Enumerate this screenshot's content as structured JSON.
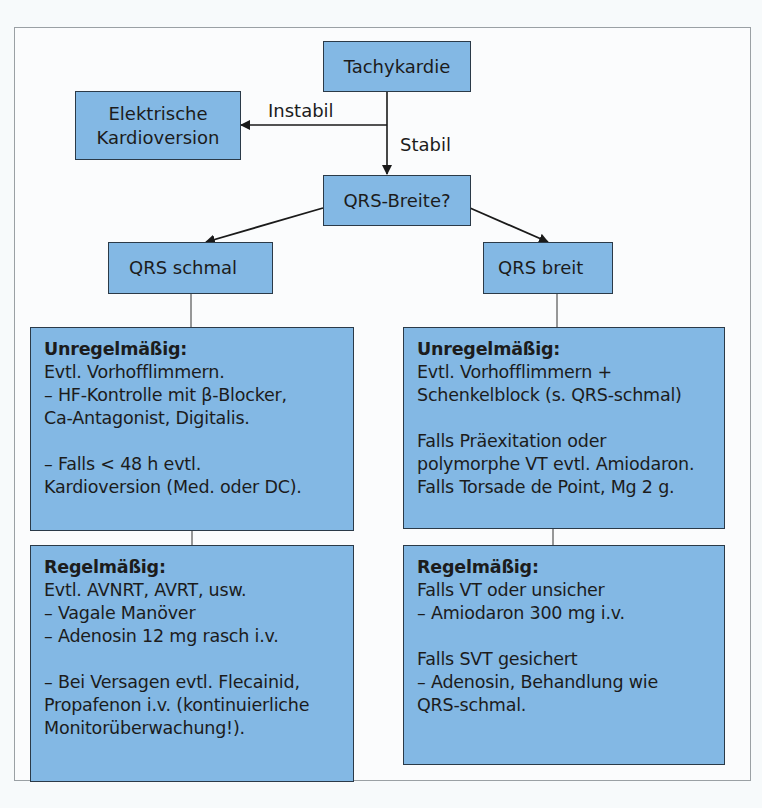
{
  "diagram": {
    "title": "Tachykardie",
    "edges": {
      "instabil_label": "Instabil",
      "stabil_label": "Stabil"
    },
    "nodes": {
      "start": "Tachykardie",
      "unstable_action": [
        "Elektrische",
        "Kardioversion"
      ],
      "decision": "QRS-Breite?",
      "narrow": "QRS schmal",
      "wide": "QRS breit"
    },
    "panels": {
      "narrow_irregular": {
        "heading": "Unregelmäßig:",
        "lines": [
          "Evtl. Vorhofflimmern.",
          "– HF-Kontrolle mit β-Blocker,",
          "Ca-Antagonist, Digitalis.",
          "",
          "– Falls < 48 h evtl.",
          "Kardioversion (Med. oder DC)."
        ]
      },
      "narrow_regular": {
        "heading": "Regelmäßig:",
        "lines": [
          "Evtl. AVNRT, AVRT, usw.",
          "– Vagale Manöver",
          "– Adenosin 12 mg rasch i.v.",
          "",
          "– Bei Versagen evtl. Flecainid,",
          "Propafenon i.v. (kontinuierliche",
          "Monitorüberwachung!)."
        ]
      },
      "wide_irregular": {
        "heading": "Unregelmäßig:",
        "lines": [
          "Evtl. Vorhofflimmern +",
          "Schenkelblock (s. QRS-schmal)",
          "",
          "Falls Präexitation oder",
          "polymorphe VT evtl. Amiodaron.",
          "Falls Torsade de Point, Mg 2 g."
        ]
      },
      "wide_regular": {
        "heading": "Regelmäßig:",
        "lines": [
          "Falls VT oder unsicher",
          "– Amiodaron 300 mg i.v.",
          "",
          "Falls SVT gesichert",
          "– Adenosin, Behandlung wie",
          "QRS-schmal."
        ]
      }
    },
    "colors": {
      "box_fill": "#83b8e4",
      "box_border": "#2b3a48",
      "line": "#1a1a1a",
      "frame": "#9aa0a4"
    }
  }
}
